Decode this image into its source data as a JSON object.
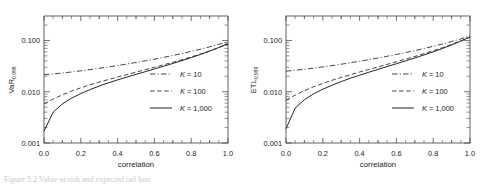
{
  "figure": {
    "caption_fragment": "Figure  5.2    Value-at-risk  and  expected  tail  loss"
  },
  "chart_data": [
    {
      "type": "line",
      "title": "",
      "panel": "left",
      "xlabel": "correlation",
      "ylabel_main": "VaR",
      "ylabel_sub": "0.999",
      "xlim": [
        0.0,
        1.0
      ],
      "ylim": [
        0.001,
        0.3
      ],
      "yscale": "log",
      "xscale": "linear",
      "grid": false,
      "legend_position": "center-right",
      "xticks": [
        "0.0",
        "0.2",
        "0.4",
        "0.6",
        "0.8",
        "1.0"
      ],
      "xtick_values": [
        0.0,
        0.2,
        0.4,
        0.6,
        0.8,
        1.0
      ],
      "yticks": [
        "0.100",
        "0.010",
        "0.001"
      ],
      "ytick_values": [
        0.1,
        0.01,
        0.001
      ],
      "x": [
        0.0,
        0.05,
        0.1,
        0.15,
        0.2,
        0.25,
        0.3,
        0.35,
        0.4,
        0.45,
        0.5,
        0.55,
        0.6,
        0.65,
        0.7,
        0.75,
        0.8,
        0.85,
        0.9,
        0.95,
        1.0
      ],
      "series": [
        {
          "name": "K = 10",
          "style": "dashdot",
          "values": [
            0.0215,
            0.0222,
            0.0232,
            0.0243,
            0.0256,
            0.027,
            0.0286,
            0.0304,
            0.0324,
            0.0347,
            0.0372,
            0.04,
            0.0432,
            0.0468,
            0.0509,
            0.0556,
            0.0611,
            0.0675,
            0.075,
            0.084,
            0.095
          ]
        },
        {
          "name": "K = 100",
          "style": "dashed",
          "values": [
            0.0058,
            0.0072,
            0.0087,
            0.0103,
            0.0119,
            0.0136,
            0.0154,
            0.0173,
            0.0194,
            0.0216,
            0.0241,
            0.0269,
            0.03,
            0.0335,
            0.0375,
            0.0422,
            0.0477,
            0.0543,
            0.0624,
            0.0724,
            0.0855
          ]
        },
        {
          "name": "K = 1,000",
          "style": "solid",
          "values": [
            0.0017,
            0.004,
            0.0058,
            0.0075,
            0.0092,
            0.011,
            0.0129,
            0.0149,
            0.017,
            0.0193,
            0.0218,
            0.0246,
            0.0278,
            0.0314,
            0.0356,
            0.0405,
            0.0463,
            0.0533,
            0.062,
            0.073,
            0.0875
          ]
        }
      ]
    },
    {
      "type": "line",
      "title": "",
      "panel": "right",
      "xlabel": "correlation",
      "ylabel_main": "ETL",
      "ylabel_sub": "0.999",
      "xlim": [
        0.0,
        1.0
      ],
      "ylim": [
        0.001,
        0.3
      ],
      "yscale": "log",
      "xscale": "linear",
      "grid": false,
      "legend_position": "center-right",
      "xticks": [
        "0.0",
        "0.2",
        "0.4",
        "0.6",
        "0.8",
        "1.0"
      ],
      "xtick_values": [
        0.0,
        0.2,
        0.4,
        0.6,
        0.8,
        1.0
      ],
      "yticks": [
        "0.100",
        "0.010",
        "0.001"
      ],
      "ytick_values": [
        0.1,
        0.01,
        0.001
      ],
      "x": [
        0.0,
        0.05,
        0.1,
        0.15,
        0.2,
        0.25,
        0.3,
        0.35,
        0.4,
        0.45,
        0.5,
        0.55,
        0.6,
        0.65,
        0.7,
        0.75,
        0.8,
        0.85,
        0.9,
        0.95,
        1.0
      ],
      "series": [
        {
          "name": "K = 10",
          "style": "dashdot",
          "values": [
            0.0252,
            0.0262,
            0.0275,
            0.0289,
            0.0305,
            0.0323,
            0.0344,
            0.0367,
            0.0393,
            0.0422,
            0.0455,
            0.0492,
            0.0533,
            0.058,
            0.0634,
            0.0696,
            0.0768,
            0.0853,
            0.0953,
            0.1075,
            0.1225
          ]
        },
        {
          "name": "K = 100",
          "style": "dashed",
          "values": [
            0.0068,
            0.0086,
            0.0105,
            0.0125,
            0.0145,
            0.0167,
            0.019,
            0.0215,
            0.0242,
            0.0272,
            0.0305,
            0.0342,
            0.0384,
            0.0432,
            0.0487,
            0.0552,
            0.0629,
            0.0722,
            0.0837,
            0.0982,
            0.117
          ]
        },
        {
          "name": "K = 1,000",
          "style": "solid",
          "values": [
            0.0019,
            0.0048,
            0.007,
            0.0091,
            0.0112,
            0.0134,
            0.0158,
            0.0183,
            0.021,
            0.024,
            0.0273,
            0.031,
            0.0352,
            0.04,
            0.0456,
            0.0522,
            0.0601,
            0.0697,
            0.0817,
            0.097,
            0.117
          ]
        }
      ]
    }
  ]
}
